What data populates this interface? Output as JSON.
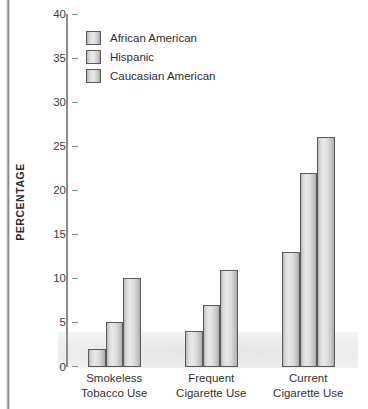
{
  "chart_data": {
    "type": "bar",
    "title": "",
    "xlabel": "",
    "ylabel": "PERCENTAGE",
    "ylim": [
      0,
      40
    ],
    "yticks": [
      "0",
      "5",
      "10",
      "15",
      "20",
      "25",
      "30",
      "35",
      "40"
    ],
    "grid": false,
    "legend_position": "top-left",
    "categories": [
      "Smokeless Tobacco Use",
      "Frequent Cigarette Use",
      "Current Cigarette Use"
    ],
    "category_lines": [
      [
        "Smokeless",
        "Tobacco Use"
      ],
      [
        "Frequent",
        "Cigarette Use"
      ],
      [
        "Current",
        "Cigarette Use"
      ]
    ],
    "series": [
      {
        "name": "African American",
        "values": [
          2,
          4,
          13
        ]
      },
      {
        "name": "Hispanic",
        "values": [
          5,
          7,
          22
        ]
      },
      {
        "name": "Caucasian American",
        "values": [
          10,
          11,
          26
        ]
      }
    ]
  },
  "legend": {
    "items": [
      {
        "label": "African American"
      },
      {
        "label": "Hispanic"
      },
      {
        "label": "Caucasian American"
      }
    ]
  },
  "colors": {
    "bar_fill_light": "#e8e8e8",
    "bar_fill_mid": "#d0d0d0",
    "bar_fill_dark": "#ababab",
    "bar_border": "#5a5a5a",
    "axis": "#8d8d8d",
    "text": "#303030",
    "background": "#ffffff"
  }
}
